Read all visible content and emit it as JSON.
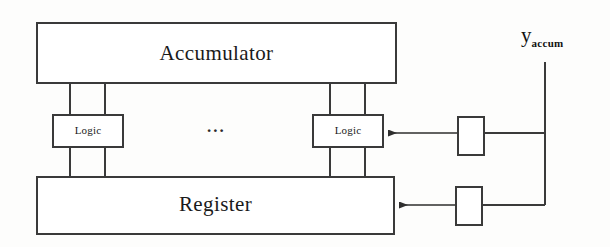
{
  "diagram": {
    "stroke_color": "#3a3a3a",
    "text_color": "#1a1a1a",
    "background_color": "#fdfdfc",
    "blocks": {
      "accumulator": {
        "label": "Accumulator",
        "x": 37,
        "y": 23,
        "width": 359,
        "height": 60
      },
      "register": {
        "label": "Register",
        "x": 37,
        "y": 177,
        "width": 357,
        "height": 57
      },
      "logic_left": {
        "label": "Logic",
        "x": 53,
        "y": 115,
        "width": 70,
        "height": 32
      },
      "logic_right": {
        "label": "Logic",
        "x": 313,
        "y": 115,
        "width": 70,
        "height": 32
      },
      "buffer_upper": {
        "label": "",
        "x": 458,
        "y": 117,
        "width": 26,
        "height": 38
      },
      "buffer_lower": {
        "label": "",
        "x": 456,
        "y": 187,
        "width": 26,
        "height": 38
      }
    },
    "ellipsis": {
      "label": "...",
      "x": 207,
      "y": 118
    },
    "signal": {
      "base": "y",
      "subscript": "accum",
      "x": 521,
      "y": 25
    },
    "connections": [
      {
        "name": "accumulator-to-logic-left-a",
        "type": "line",
        "x1": 70,
        "y1": 83,
        "x2": 70,
        "y2": 115
      },
      {
        "name": "accumulator-to-logic-left-b",
        "type": "line",
        "x1": 105,
        "y1": 83,
        "x2": 105,
        "y2": 115
      },
      {
        "name": "accumulator-to-logic-right-a",
        "type": "line",
        "x1": 330,
        "y1": 83,
        "x2": 330,
        "y2": 115
      },
      {
        "name": "accumulator-to-logic-right-b",
        "type": "line",
        "x1": 365,
        "y1": 83,
        "x2": 365,
        "y2": 115
      },
      {
        "name": "logic-left-to-register-a",
        "type": "line",
        "x1": 70,
        "y1": 147,
        "x2": 70,
        "y2": 177
      },
      {
        "name": "logic-left-to-register-b",
        "type": "line",
        "x1": 105,
        "y1": 147,
        "x2": 105,
        "y2": 177
      },
      {
        "name": "logic-right-to-register-a",
        "type": "line",
        "x1": 330,
        "y1": 147,
        "x2": 330,
        "y2": 177
      },
      {
        "name": "logic-right-to-register-b",
        "type": "line",
        "x1": 365,
        "y1": 147,
        "x2": 365,
        "y2": 177
      },
      {
        "name": "buffer-upper-to-logic-right-arrow",
        "type": "arrow",
        "x1": 458,
        "y1": 133,
        "x2": 385,
        "y2": 133
      },
      {
        "name": "signal-bus-to-buffer-upper",
        "type": "line",
        "x1": 484,
        "y1": 133,
        "x2": 545,
        "y2": 133
      },
      {
        "name": "buffer-lower-to-register-arrow",
        "type": "arrow",
        "x1": 456,
        "y1": 205,
        "x2": 396,
        "y2": 205
      },
      {
        "name": "signal-bus-to-buffer-lower",
        "type": "line",
        "x1": 482,
        "y1": 205,
        "x2": 545,
        "y2": 205
      },
      {
        "name": "signal-vertical-bus",
        "type": "line",
        "x1": 545,
        "y1": 62,
        "x2": 545,
        "y2": 205
      }
    ]
  }
}
